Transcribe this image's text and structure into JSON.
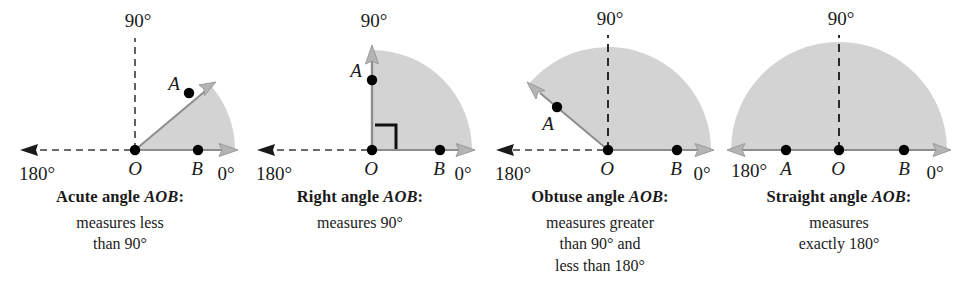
{
  "figure": {
    "shade_color": "#d3d3d3",
    "line_color": "#3a3a3a",
    "point_color": "#000000",
    "background": "#ffffff"
  },
  "panels": [
    {
      "id": "acute",
      "angle_measure_deg": 40,
      "labels": {
        "deg90": "90°",
        "deg180": "180°",
        "deg0": "0°",
        "point_a": "A",
        "point_o": "O",
        "point_b": "B"
      },
      "caption_title_prefix": "Acute angle ",
      "caption_title_name": "AOB",
      "caption_title_suffix": ":",
      "caption_lines": [
        "measures less",
        "than 90°"
      ]
    },
    {
      "id": "right",
      "angle_measure_deg": 90,
      "labels": {
        "deg90": "90°",
        "deg180": "180°",
        "deg0": "0°",
        "point_a": "A",
        "point_o": "O",
        "point_b": "B"
      },
      "caption_title_prefix": "Right angle ",
      "caption_title_name": "AOB",
      "caption_title_suffix": ":",
      "caption_lines": [
        "measures 90°"
      ]
    },
    {
      "id": "obtuse",
      "angle_measure_deg": 140,
      "labels": {
        "deg90": "90°",
        "deg180": "180°",
        "deg0": "0°",
        "point_a": "A",
        "point_o": "O",
        "point_b": "B"
      },
      "caption_title_prefix": "Obtuse angle ",
      "caption_title_name": "AOB",
      "caption_title_suffix": ":",
      "caption_lines": [
        "measures greater",
        "than 90° and",
        "less than 180°"
      ]
    },
    {
      "id": "straight",
      "angle_measure_deg": 180,
      "labels": {
        "deg90": "90°",
        "deg180": "180°",
        "deg0": "0°",
        "point_a": "A",
        "point_o": "O",
        "point_b": "B"
      },
      "caption_title_prefix": "Straight angle ",
      "caption_title_name": "AOB",
      "caption_title_suffix": ":",
      "caption_lines": [
        "measures",
        "exactly 180°"
      ]
    }
  ]
}
